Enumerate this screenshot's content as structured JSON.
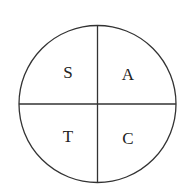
{
  "diagram": {
    "type": "quadrant-circle",
    "quadrants": {
      "top_left": "S",
      "top_right": "A",
      "bottom_left": "T",
      "bottom_right": "C"
    },
    "stroke_color": "#333333",
    "text_color": "#222222"
  }
}
